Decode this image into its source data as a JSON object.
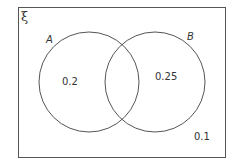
{
  "diagram": {
    "type": "venn",
    "universal_set_symbol": "ξ",
    "sets": [
      {
        "name": "A",
        "only_value": "0.2"
      },
      {
        "name": "B",
        "only_value": "0.25"
      }
    ],
    "intersection_value": "",
    "outside_value": "0.1",
    "colors": {
      "stroke": "#555555",
      "text": "#333333",
      "background": "#ffffff"
    }
  }
}
